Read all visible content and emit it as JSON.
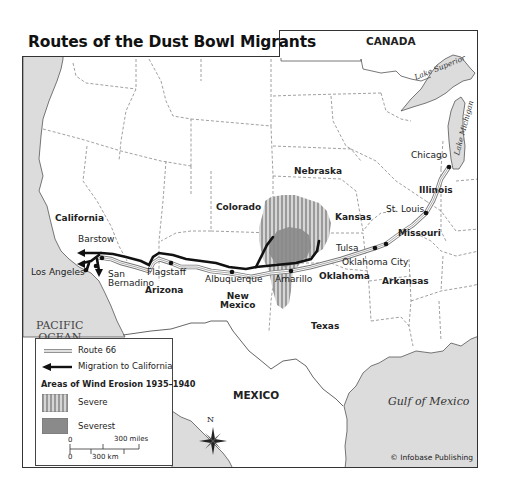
{
  "map": {
    "title": "Routes of the Dust Bowl Migrants",
    "credit": "© Infobase Publishing",
    "countries": {
      "canada": "CANADA",
      "mexico": "MEXICO"
    },
    "water_bodies": {
      "pacific": [
        "PACIFIC",
        "OCEAN"
      ],
      "gulf": "Gulf of Mexico",
      "lake_superior": "Lake Superior",
      "lake_michigan": "Lake Michigan"
    },
    "states": {
      "california": "California",
      "arizona": "Arizona",
      "new_mexico": [
        "New",
        "Mexico"
      ],
      "colorado": "Colorado",
      "nebraska": "Nebraska",
      "kansas": "Kansas",
      "oklahoma": "Oklahoma",
      "texas": "Texas",
      "missouri": "Missouri",
      "arkansas": "Arkansas",
      "illinois": "Illinois"
    },
    "cities": {
      "chicago": "Chicago",
      "st_louis": "St. Louis",
      "tulsa": "Tulsa",
      "oklahoma_city": "Oklahoma City",
      "amarillo": "Amarillo",
      "albuquerque": "Albuquerque",
      "flagstaff": "Flagstaff",
      "barstow": "Barstow",
      "san_bernadino": [
        "San",
        "Bernadino"
      ],
      "los_angeles": "Los Angeles"
    },
    "compass": "N"
  },
  "legend": {
    "route66": "Route 66",
    "migration": "Migration to California",
    "erosion_heading": "Areas of Wind Erosion 1935–1940",
    "severe": "Severe",
    "severest": "Severest",
    "scale": {
      "zero_top": "0",
      "miles": "300 miles",
      "zero_bottom": "0",
      "km": "300 km"
    }
  },
  "colors": {
    "water": "#dcdcdc",
    "land": "#ffffff",
    "border": "#666666",
    "severe_stripe": "#9a9a9a",
    "severest": "#8a8a8a",
    "migration": "#111111"
  }
}
